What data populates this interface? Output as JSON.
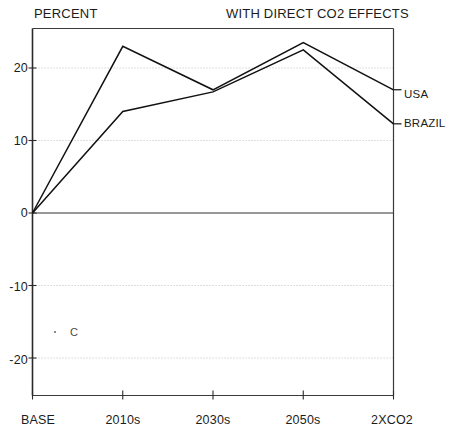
{
  "header": {
    "left_label": "PERCENT",
    "right_label": "WITH DIRECT CO2 EFFECTS"
  },
  "annotations": {
    "stray_mark_text": "C"
  },
  "chart_data": {
    "type": "line",
    "title": "WITH DIRECT CO2 EFFECTS",
    "xlabel": "",
    "ylabel": "PERCENT",
    "categories": [
      "BASE",
      "2010s",
      "2030s",
      "2050s",
      "2XCO2"
    ],
    "series": [
      {
        "name": "USA",
        "values": [
          0,
          23.0,
          17.0,
          23.5,
          17.0
        ]
      },
      {
        "name": "BRAZIL",
        "values": [
          0,
          14.0,
          16.7,
          22.5,
          12.3
        ]
      }
    ],
    "ylim": [
      -24,
      26
    ],
    "yticks": [
      20,
      10,
      0,
      -10,
      -20
    ],
    "ytick_labels": [
      "20",
      "10",
      "0",
      "-10",
      "-20"
    ],
    "grid": true,
    "legend_position": "right-inline",
    "line_color": "#111111",
    "grid_color": "#bdbdbd",
    "axis_color": "#3a3a3a"
  }
}
